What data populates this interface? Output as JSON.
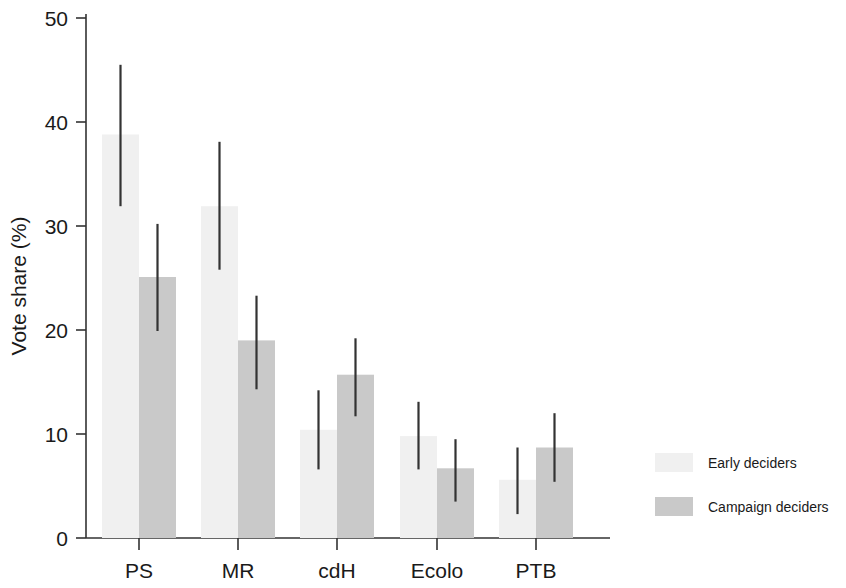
{
  "chart_data": {
    "type": "bar",
    "title": "",
    "subtitle": "",
    "xlabel": "",
    "ylabel": "Vote share (%)",
    "categories": [
      "PS",
      "MR",
      "cdH",
      "Ecolo",
      "PTB"
    ],
    "ylim": [
      0,
      50
    ],
    "yticks": [
      0,
      10,
      20,
      30,
      40,
      50
    ],
    "ytick_labels": [
      "0",
      "10",
      "20",
      "30",
      "40",
      "50"
    ],
    "grid": false,
    "legend_position": "right",
    "error_bars": "vertical lines (confidence intervals)",
    "series": [
      {
        "name": "Early deciders",
        "color": "#f0f0f0",
        "values": [
          38.8,
          31.9,
          10.4,
          9.8,
          5.6
        ],
        "ci_low": [
          31.9,
          25.8,
          6.6,
          6.6,
          2.3
        ],
        "ci_high": [
          45.5,
          38.1,
          14.2,
          13.1,
          8.7
        ]
      },
      {
        "name": "Campaign deciders",
        "color": "#c9c9c9",
        "values": [
          25.1,
          19.0,
          15.7,
          6.7,
          8.7
        ],
        "ci_low": [
          19.9,
          14.3,
          11.7,
          3.5,
          5.4
        ],
        "ci_high": [
          30.2,
          23.3,
          19.2,
          9.5,
          12.0
        ]
      }
    ]
  },
  "legend": {
    "entries": [
      {
        "label": "Early deciders",
        "swatch_color": "#f0f0f0"
      },
      {
        "label": "Campaign deciders",
        "swatch_color": "#c9c9c9"
      }
    ]
  },
  "axes": {
    "y_axis_title": "Vote share (%)",
    "y_tick_labels": [
      "50",
      "40",
      "30",
      "20",
      "10",
      "0"
    ],
    "x_tick_labels": [
      "PS",
      "MR",
      "cdH",
      "Ecolo",
      "PTB"
    ]
  },
  "colors": {
    "axis": "#333333",
    "error_bar": "#333333",
    "early_fill": "#f0f0f0",
    "campaign_fill": "#c9c9c9",
    "background": "#ffffff"
  }
}
